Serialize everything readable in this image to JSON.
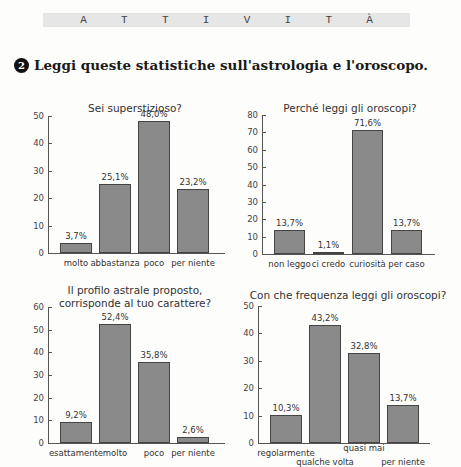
{
  "banner": {
    "letters": [
      "A",
      "T",
      "T",
      "I",
      "V",
      "I",
      "T",
      "À"
    ]
  },
  "exercise": {
    "number": "2",
    "instruction": "Leggi queste statistiche sull'astrologia e l'oroscopo."
  },
  "chart_data": [
    {
      "type": "bar",
      "title": "Sei superstizioso?",
      "categories": [
        "molto",
        "abbastanza",
        "poco",
        "per niente"
      ],
      "values": [
        3.7,
        25.1,
        48.0,
        23.2
      ],
      "labels": [
        "3,7%",
        "25,1%",
        "48,0%",
        "23,2%"
      ],
      "yticks": [
        "0",
        "10",
        "20",
        "30",
        "40",
        "50"
      ],
      "ylim": [
        0,
        50
      ],
      "xlabel": "",
      "ylabel": "",
      "grid": false
    },
    {
      "type": "bar",
      "title": "Perché leggi gli oroscopi?",
      "categories": [
        "non leggo",
        "ci credo",
        "curiosità",
        "per caso"
      ],
      "values": [
        13.7,
        1.1,
        71.6,
        13.7
      ],
      "labels": [
        "13,7%",
        "1,1%",
        "71,6%",
        "13,7%"
      ],
      "yticks": [
        "0",
        "10",
        "20",
        "30",
        "40",
        "50",
        "60",
        "70",
        "80"
      ],
      "ylim": [
        0,
        80
      ],
      "xlabel": "",
      "ylabel": "",
      "grid": false
    },
    {
      "type": "bar",
      "title": "Il profilo astrale proposto, corrisponde al tuo carattere?",
      "title_lines": [
        "Il profilo astrale proposto,",
        "corrisponde al tuo carattere?"
      ],
      "categories": [
        "esattamente",
        "molto",
        "poco",
        "per niente"
      ],
      "values": [
        9.2,
        52.4,
        35.8,
        2.6
      ],
      "labels": [
        "9,2%",
        "52,4%",
        "35,8%",
        "2,6%"
      ],
      "yticks": [
        "0",
        "10",
        "20",
        "30",
        "40",
        "50",
        "60"
      ],
      "ylim": [
        0,
        60
      ],
      "xlabel": "",
      "ylabel": "",
      "grid": false
    },
    {
      "type": "bar",
      "title": "Con che frequenza leggi gli oroscopi?",
      "categories": [
        "regolarmente",
        "qualche volta",
        "quasi mai",
        "per niente"
      ],
      "values": [
        10.3,
        43.2,
        32.8,
        13.7
      ],
      "labels": [
        "10,3%",
        "43,2%",
        "32,8%",
        "13,7%"
      ],
      "yticks": [
        "0",
        "10",
        "20",
        "30",
        "40",
        "50"
      ],
      "ylim": [
        0,
        50
      ],
      "xlabel": "",
      "ylabel": "",
      "grid": false
    }
  ],
  "colors": {
    "bar_fill": "#8a8a8a",
    "bar_border": "#444444",
    "banner_bg": "#e6e6e6",
    "badge_bg": "#111111"
  }
}
